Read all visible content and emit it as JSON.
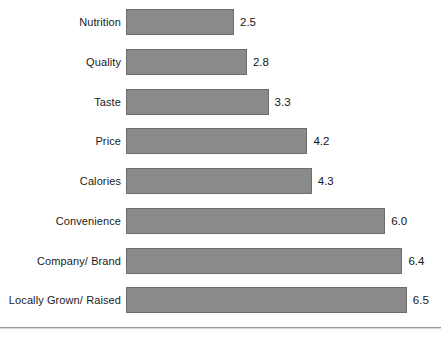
{
  "chart_data": {
    "type": "bar",
    "orientation": "horizontal",
    "title": "",
    "subtitle": "",
    "xlabel": "",
    "ylabel": "",
    "grid": false,
    "legend": null,
    "xlim": [
      0,
      6.5
    ],
    "categories": [
      "Nutrition",
      "Quality",
      "Taste",
      "Price",
      "Calories",
      "Convenience",
      "Company/ Brand",
      "Locally Grown/ Raised"
    ],
    "values": [
      2.5,
      2.8,
      3.3,
      4.2,
      4.3,
      6.0,
      6.4,
      6.5
    ],
    "value_labels": [
      "2.5",
      "2.8",
      "3.3",
      "4.2",
      "4.3",
      "6.0",
      "6.4",
      "6.5"
    ],
    "bars": [
      {
        "category": "Nutrition",
        "value": 2.5,
        "label": "2.5"
      },
      {
        "category": "Quality",
        "value": 2.8,
        "label": "2.8"
      },
      {
        "category": "Taste",
        "value": 3.3,
        "label": "3.3"
      },
      {
        "category": "Price",
        "value": 4.2,
        "label": "4.2"
      },
      {
        "category": "Calories",
        "value": 4.3,
        "label": "4.3"
      },
      {
        "category": "Convenience",
        "value": 6.0,
        "label": "6.0"
      },
      {
        "category": "Company/ Brand",
        "value": 6.4,
        "label": "6.4"
      },
      {
        "category": "Locally Grown/ Raised",
        "value": 6.5,
        "label": "6.5"
      }
    ]
  },
  "style": {
    "bar_fill": "#8a8a8a",
    "bar_border": "#6d6d6d",
    "label_color": "#1c1c1c",
    "value_color": "#141414",
    "axis_rule_color": "#9a9a9a",
    "background": "#ffffff"
  },
  "geometry": {
    "bar_origin_x": 126,
    "px_per_unit": 43.2,
    "first_bar_top": 9,
    "row_pitch": 39.75,
    "bar_height": 26,
    "label_right_edge": 121,
    "value_gap": 6,
    "axis_rule_y": 327
  }
}
